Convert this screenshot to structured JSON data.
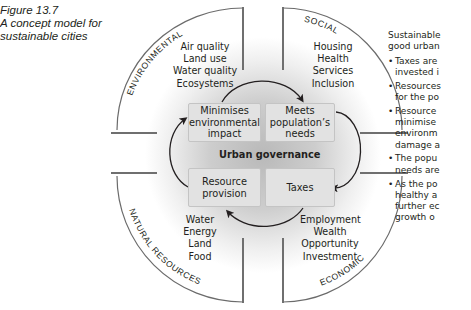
{
  "caption": {
    "figure_number": "Figure 13.7",
    "line1": "A concept model for",
    "line2": "sustainable cities"
  },
  "quadrants": {
    "environmental": {
      "label": "ENVIRONMENTAL",
      "items": [
        "Air quality",
        "Land use",
        "Water quality",
        "Ecosystems"
      ]
    },
    "social": {
      "label": "SOCIAL",
      "items": [
        "Housing",
        "Health",
        "Services",
        "Inclusion"
      ]
    },
    "natural_resources": {
      "label": "NATURAL RESOURCES",
      "items": [
        "Water",
        "Energy",
        "Land",
        "Food"
      ]
    },
    "economic": {
      "label": "ECONOMIC",
      "items": [
        "Employment",
        "Wealth",
        "Opportunity",
        "Investment"
      ]
    }
  },
  "center": {
    "title": "Urban governance",
    "boxes": {
      "top_left": [
        "Minimises",
        "environmental",
        "impact"
      ],
      "top_right": [
        "Meets",
        "population’s",
        "needs"
      ],
      "bottom_left": [
        "Resource",
        "provision"
      ],
      "bottom_right": [
        "Taxes"
      ]
    }
  },
  "side_text": {
    "intro_line1": "Sustainable",
    "intro_line2": "good urban",
    "bullets": [
      [
        "Taxes are",
        "invested i"
      ],
      [
        "Resources",
        "for the po"
      ],
      [
        "Resource",
        "minimise",
        "environm",
        "damage a"
      ],
      [
        "The popu",
        "needs are"
      ],
      [
        "As the po",
        "healthy a",
        "further ec",
        "growth o"
      ]
    ]
  },
  "colors": {
    "line": "#5a5a5a",
    "arrow": "#231f20",
    "box_fill": "#e2e2e2",
    "shade": "#bdbdbd"
  }
}
